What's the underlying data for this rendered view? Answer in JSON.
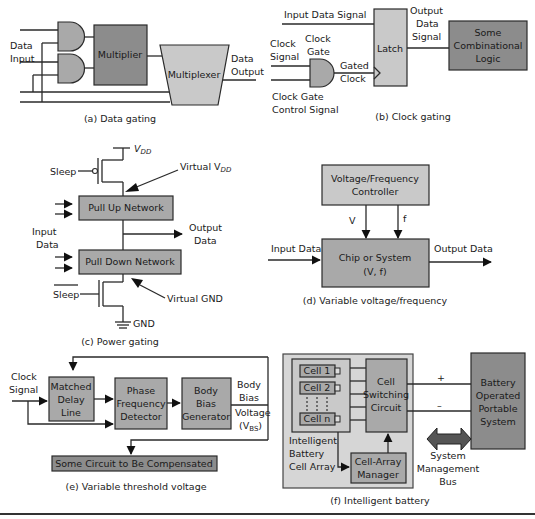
{
  "panels": {
    "a": {
      "caption": "(a) Data gating",
      "data_input_1": "Data",
      "data_input_2": "Input",
      "multiplier": "Multiplier",
      "multiplexer": "Multiplexer",
      "data_output_1": "Data",
      "data_output_2": "Output"
    },
    "b": {
      "caption": "(b) Clock gating",
      "input_data_signal": "Input Data Signal",
      "clock_signal_1": "Clock",
      "clock_signal_2": "Signal",
      "clock_gate_1": "Clock",
      "clock_gate_2": "Gate",
      "gated_clock_1": "Gated",
      "gated_clock_2": "Clock",
      "control_1": "Clock Gate",
      "control_2": "Control Signal",
      "latch": "Latch",
      "output_1": "Output",
      "output_2": "Data",
      "output_3": "Signal",
      "logic_1": "Some",
      "logic_2": "Combinational",
      "logic_3": "Logic"
    },
    "c": {
      "caption": "(c) Power gating",
      "vdd": "V",
      "vdd_sub": "DD",
      "sleep": "Sleep",
      "virtual_vdd": "Virtual V",
      "virtual_vdd_sub": "DD",
      "pull_up": "Pull Up Network",
      "pull_down": "Pull Down Network",
      "input_1": "Input",
      "input_2": "Data",
      "output_1": "Output",
      "output_2": "Data",
      "sleep_bar": "Sleep",
      "virtual_gnd": "Virtual GND",
      "gnd": "GND"
    },
    "d": {
      "caption": "(d) Variable voltage/frequency",
      "controller_1": "Voltage/Frequency",
      "controller_2": "Controller",
      "v": "V",
      "f": "f",
      "input": "Input Data",
      "output": "Output Data",
      "chip_1": "Chip or System",
      "chip_2": "(V, f)"
    },
    "e": {
      "caption": "(e) Variable threshold voltage",
      "clock_1": "Clock",
      "clock_2": "Signal",
      "delay_1": "Matched",
      "delay_2": "Delay",
      "delay_3": "Line",
      "pfd_1": "Phase",
      "pfd_2": "Frequency",
      "pfd_3": "Detector",
      "bbg_1": "Body",
      "bbg_2": "Bias",
      "bbg_3": "Generator",
      "vbs_1": "Body",
      "vbs_2": "Bias",
      "vbs_3": "Voltage",
      "vbs_4": "(V",
      "vbs_sub": "BS",
      "vbs_5": ")",
      "circuit": "Some Circuit to Be Compensated"
    },
    "f": {
      "caption": "(f) Intelligent battery",
      "cells": [
        "Cell 1",
        "Cell 2",
        "Cell n"
      ],
      "array_1": "Intelligent",
      "array_2": "Battery",
      "array_3": "Cell Array",
      "switch_1": "Cell",
      "switch_2": "Switching",
      "switch_3": "Circuit",
      "manager_1": "Cell-Array",
      "manager_2": "Manager",
      "plus": "+",
      "minus": "–",
      "system_1": "Battery",
      "system_2": "Operated",
      "system_3": "Portable",
      "system_4": "System",
      "bus_1": "System",
      "bus_2": "Management",
      "bus_3": "Bus"
    }
  }
}
